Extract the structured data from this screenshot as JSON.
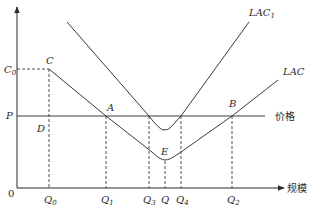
{
  "diagram": {
    "type": "economics-cost-curves",
    "axes": {
      "origin_label": "0",
      "x_label": "规模",
      "y_ticks": [
        {
          "id": "C0",
          "base": "C",
          "sub": "0"
        },
        {
          "id": "P",
          "base": "P",
          "sub": ""
        }
      ],
      "x_ticks": [
        {
          "id": "Q0",
          "base": "Q",
          "sub": "0"
        },
        {
          "id": "Q1",
          "base": "Q",
          "sub": "1"
        },
        {
          "id": "Q3",
          "base": "Q",
          "sub": "3"
        },
        {
          "id": "Q",
          "base": "Q",
          "sub": ""
        },
        {
          "id": "Q4",
          "base": "Q",
          "sub": "4"
        },
        {
          "id": "Q2",
          "base": "Q",
          "sub": "2"
        }
      ]
    },
    "price_line_label": "价格",
    "curves": [
      {
        "id": "LAC1",
        "base": "LAC",
        "sub": "1"
      },
      {
        "id": "LAC",
        "base": "LAC",
        "sub": ""
      }
    ],
    "points": [
      {
        "id": "C",
        "label": "C"
      },
      {
        "id": "D",
        "label": "D"
      },
      {
        "id": "A",
        "label": "A"
      },
      {
        "id": "B",
        "label": "B"
      },
      {
        "id": "E",
        "label": "E"
      }
    ],
    "colors": {
      "line": "#3a3a3a",
      "text": "#2a2a2a",
      "background": "#ffffff"
    }
  }
}
